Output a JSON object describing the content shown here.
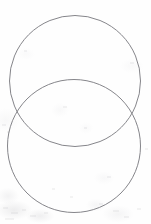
{
  "image": {
    "title": "Two overlapping circles (vesica piscis diagram)",
    "width": 151,
    "height": 224,
    "background_color": "#fdfdfd",
    "medium": "scanned paper with faint grain"
  },
  "figure": {
    "name": "overlapping-circles-diagram",
    "stroke_color": "#77777d",
    "stroke_width": 0.9,
    "fill": "none",
    "shapes": [
      {
        "name": "upper-circle",
        "type": "circle",
        "center_x": 75,
        "center_y": 81,
        "radius": 65.5,
        "top_y": 15,
        "bottom_y": 147,
        "left_x": 10,
        "right_x": 140
      },
      {
        "name": "lower-circle",
        "type": "circle",
        "center_x": 74,
        "center_y": 146,
        "radius": 66.5,
        "top_y": 79,
        "bottom_y": 213,
        "left_x": 8,
        "right_x": 140
      }
    ],
    "intersections": [
      {
        "name": "left-intersection-point",
        "x": 14,
        "y": 112
      },
      {
        "name": "right-intersection-point",
        "x": 136,
        "y": 113
      }
    ],
    "overlap_region": {
      "name": "lens-region",
      "top_y": 79,
      "bottom_y": 147
    }
  }
}
